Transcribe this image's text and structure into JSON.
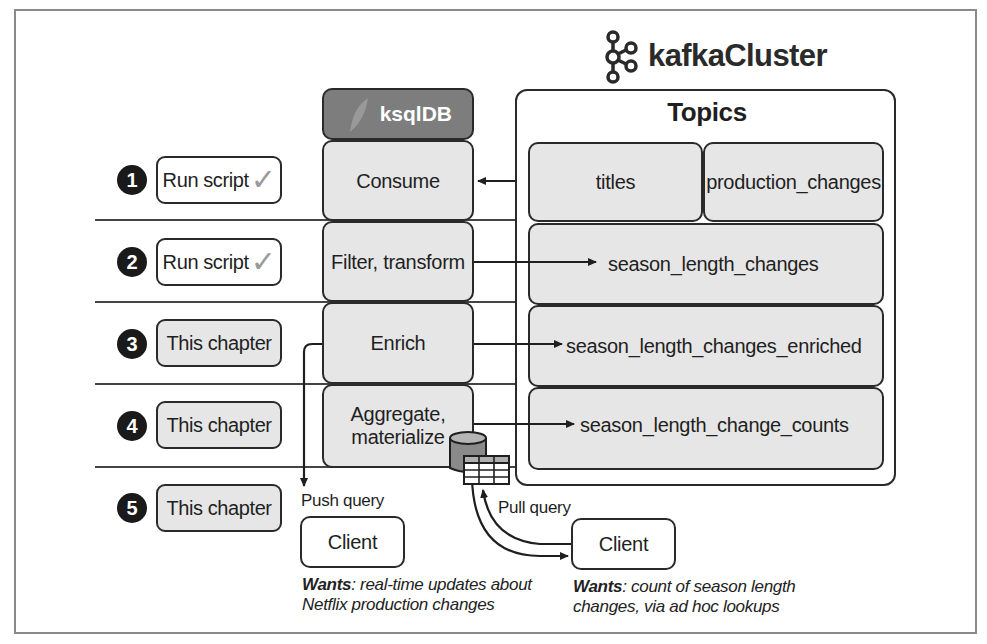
{
  "header": {
    "cluster_title": "kafkaCluster",
    "engine_label": "ksqlDB",
    "topics_title": "Topics"
  },
  "steps": [
    {
      "number": "1",
      "status": "Run script",
      "done": true,
      "stage": "Consume"
    },
    {
      "number": "2",
      "status": "Run script",
      "done": true,
      "stage": "Filter, transform"
    },
    {
      "number": "3",
      "status": "This chapter",
      "done": false,
      "stage": "Enrich"
    },
    {
      "number": "4",
      "status": "This chapter",
      "done": false,
      "stage": "Aggregate, materialize"
    },
    {
      "number": "5",
      "status": "This chapter",
      "done": false,
      "stage": ""
    }
  ],
  "check_glyph": "✓",
  "topics": {
    "titles": "titles",
    "production_changes": "production_changes",
    "season_length_changes": "season_length_changes",
    "season_length_changes_enriched": "season_length_changes_enriched",
    "season_length_change_counts": "season_length_change_counts"
  },
  "queries": {
    "push_label": "Push query",
    "pull_label": "Pull query"
  },
  "clients": {
    "push": {
      "label": "Client",
      "wants_prefix": "Wants",
      "wants_text": ": real-time updates about Netflix production changes"
    },
    "pull": {
      "label": "Client",
      "wants_prefix": "Wants",
      "wants_text": ": count of season length changes, via ad hoc lookups"
    }
  },
  "colors": {
    "stage_fill": "#e6e6e6",
    "engine_fill": "#7d7d7d",
    "line": "#2a2a2a",
    "check": "#9a9a9a"
  }
}
